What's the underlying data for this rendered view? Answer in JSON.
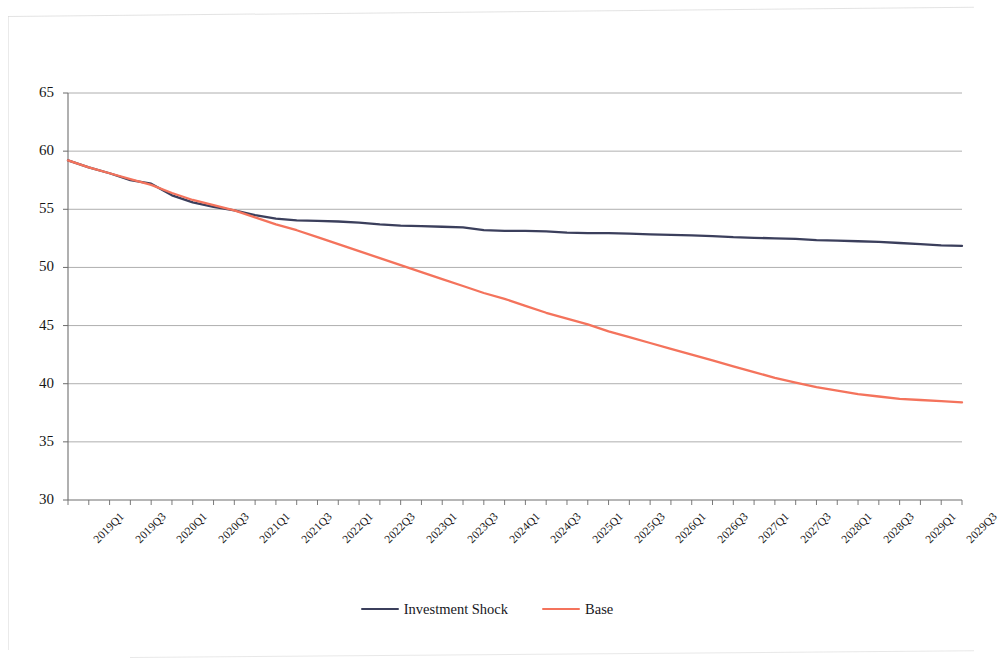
{
  "chart_data": {
    "type": "line",
    "title": "",
    "subtitle": "",
    "xlabel": "",
    "ylabel": "",
    "ylim": [
      30,
      65
    ],
    "ytick_step": 5,
    "yticks": [
      "30",
      "35",
      "40",
      "45",
      "50",
      "55",
      "60",
      "65"
    ],
    "grid": true,
    "grid_axis": "y",
    "legend_position": "bottom-center",
    "categories": [
      "2019Q1",
      "2019Q2",
      "2019Q3",
      "2019Q4",
      "2020Q1",
      "2020Q2",
      "2020Q3",
      "2020Q4",
      "2021Q1",
      "2021Q2",
      "2021Q3",
      "2021Q4",
      "2022Q1",
      "2022Q2",
      "2022Q3",
      "2022Q4",
      "2023Q1",
      "2023Q2",
      "2023Q3",
      "2023Q4",
      "2024Q1",
      "2024Q2",
      "2024Q3",
      "2024Q4",
      "2025Q1",
      "2025Q2",
      "2025Q3",
      "2025Q4",
      "2026Q1",
      "2026Q2",
      "2026Q3",
      "2026Q4",
      "2027Q1",
      "2027Q2",
      "2027Q3",
      "2027Q4",
      "2028Q1",
      "2028Q2",
      "2028Q3",
      "2028Q4",
      "2029Q1",
      "2029Q2",
      "2029Q3",
      "2029Q4"
    ],
    "xtick_labels": [
      "2019Q1",
      "2019Q3",
      "2020Q1",
      "2020Q3",
      "2021Q1",
      "2021Q3",
      "2022Q1",
      "2022Q3",
      "2023Q1",
      "2023Q3",
      "2024Q1",
      "2024Q3",
      "2025Q1",
      "2025Q3",
      "2026Q1",
      "2026Q3",
      "2027Q1",
      "2027Q3",
      "2028Q1",
      "2028Q3",
      "2029Q1",
      "2029Q3"
    ],
    "series": [
      {
        "name": "Investment Shock",
        "color": "#3b3f5c",
        "values": [
          59.2,
          58.6,
          58.1,
          57.5,
          57.2,
          56.2,
          55.6,
          55.2,
          54.9,
          54.5,
          54.2,
          54.05,
          54.0,
          53.95,
          53.85,
          53.7,
          53.6,
          53.55,
          53.5,
          53.45,
          53.2,
          53.15,
          53.15,
          53.1,
          53.0,
          52.95,
          52.95,
          52.9,
          52.85,
          52.8,
          52.75,
          52.7,
          52.6,
          52.55,
          52.5,
          52.45,
          52.35,
          52.3,
          52.25,
          52.2,
          52.1,
          52.0,
          51.9,
          51.85
        ]
      },
      {
        "name": "Base",
        "color": "#f4735c",
        "values": [
          59.2,
          58.6,
          58.1,
          57.6,
          57.1,
          56.4,
          55.8,
          55.35,
          54.9,
          54.3,
          53.7,
          53.2,
          52.6,
          52.0,
          51.4,
          50.8,
          50.2,
          49.6,
          49.0,
          48.4,
          47.8,
          47.3,
          46.7,
          46.1,
          45.6,
          45.1,
          44.5,
          44.0,
          43.5,
          43.0,
          42.5,
          42.0,
          41.5,
          41.0,
          40.5,
          40.1,
          39.7,
          39.4,
          39.1,
          38.9,
          38.7,
          38.6,
          38.5,
          38.4
        ]
      }
    ]
  },
  "legend": {
    "items": [
      {
        "label": "Investment Shock",
        "color": "#3b3f5c"
      },
      {
        "label": "Base",
        "color": "#f4735c"
      }
    ]
  },
  "colors": {
    "investment_shock": "#3b3f5c",
    "base": "#f4735c",
    "gridline": "#9a9a9a",
    "axis": "#6b6b6b"
  }
}
